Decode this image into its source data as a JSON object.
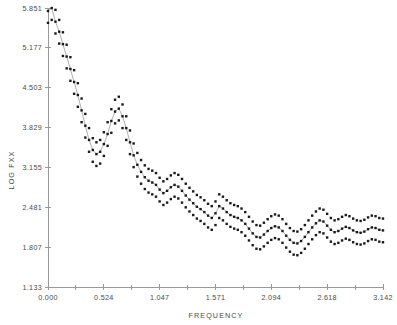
{
  "chart_data": {
    "type": "scatter",
    "title": "",
    "subtitle": "",
    "xlabel": "FREQUENCY",
    "ylabel": "LOG FXX",
    "xlim": [
      0.0,
      3.142
    ],
    "ylim": [
      1.133,
      5.851
    ],
    "grid": false,
    "legend": null,
    "legend_position": "none",
    "marker": "filled-square",
    "marker_color": "#1a1a1a",
    "line_color": "#8c8c8c",
    "background_color": "#ffffff",
    "axis_color": "#9a9a9a",
    "text_color": "#4a4a4a",
    "xticks": [
      0.0,
      0.524,
      1.047,
      1.571,
      2.094,
      2.618,
      3.142
    ],
    "xtick_labels": [
      "0.000",
      "0.524",
      "1.047",
      "1.571",
      "2.094",
      "2.618",
      "3.142"
    ],
    "x_minor_ticks_between": 1,
    "yticks": [
      1.133,
      1.807,
      2.481,
      3.155,
      3.829,
      4.503,
      5.177,
      5.851
    ],
    "ytick_labels": [
      "1.133",
      "1.807",
      "2.481",
      "3.155",
      "3.829",
      "4.503",
      "5.177",
      "5.851"
    ],
    "y_tick_step": 0.674,
    "series": [
      {
        "name": "spectral-estimate",
        "role": "center",
        "x": [
          0.0,
          0.035,
          0.07,
          0.105,
          0.14,
          0.175,
          0.21,
          0.245,
          0.28,
          0.315,
          0.35,
          0.385,
          0.42,
          0.454,
          0.489,
          0.524,
          0.559,
          0.594,
          0.629,
          0.664,
          0.699,
          0.734,
          0.769,
          0.803,
          0.838,
          0.873,
          0.908,
          0.943,
          0.978,
          1.013,
          1.047,
          1.082,
          1.117,
          1.152,
          1.187,
          1.222,
          1.257,
          1.292,
          1.327,
          1.362,
          1.396,
          1.431,
          1.466,
          1.501,
          1.536,
          1.571,
          1.606,
          1.641,
          1.676,
          1.711,
          1.746,
          1.78,
          1.815,
          1.85,
          1.885,
          1.92,
          1.955,
          1.99,
          2.025,
          2.06,
          2.094,
          2.129,
          2.164,
          2.199,
          2.234,
          2.269,
          2.304,
          2.339,
          2.374,
          2.409,
          2.443,
          2.478,
          2.513,
          2.548,
          2.583,
          2.618,
          2.653,
          2.688,
          2.723,
          2.758,
          2.793,
          2.827,
          2.862,
          2.897,
          2.932,
          2.967,
          3.002,
          3.037,
          3.072,
          3.107,
          3.142
        ],
        "y": [
          5.8,
          5.85,
          5.62,
          5.45,
          5.24,
          5.03,
          4.82,
          4.6,
          4.38,
          4.12,
          3.86,
          3.62,
          3.45,
          3.38,
          3.42,
          3.55,
          3.72,
          3.94,
          4.1,
          4.15,
          4.02,
          3.82,
          3.58,
          3.36,
          3.2,
          3.08,
          2.99,
          2.93,
          2.9,
          2.86,
          2.78,
          2.72,
          2.76,
          2.82,
          2.86,
          2.83,
          2.76,
          2.68,
          2.61,
          2.55,
          2.49,
          2.45,
          2.4,
          2.34,
          2.3,
          2.38,
          2.5,
          2.46,
          2.4,
          2.35,
          2.32,
          2.3,
          2.26,
          2.2,
          2.12,
          2.04,
          1.98,
          1.97,
          2.02,
          2.08,
          2.13,
          2.16,
          2.14,
          2.08,
          2.0,
          1.93,
          1.88,
          1.87,
          1.91,
          1.98,
          2.06,
          2.14,
          2.21,
          2.26,
          2.24,
          2.17,
          2.1,
          2.06,
          2.08,
          2.12,
          2.15,
          2.13,
          2.09,
          2.06,
          2.05,
          2.07,
          2.11,
          2.14,
          2.13,
          2.1,
          2.09
        ]
      },
      {
        "name": "upper-confidence-limit",
        "role": "upper",
        "offset": 0.2
      },
      {
        "name": "lower-confidence-limit",
        "role": "lower",
        "offset": -0.2
      }
    ]
  }
}
